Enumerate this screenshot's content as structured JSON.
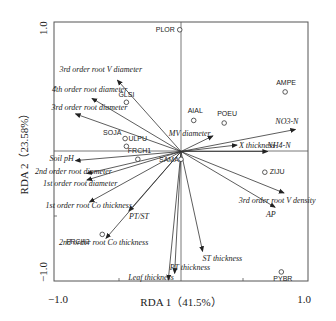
{
  "chart_data": {
    "type": "scatter",
    "subtype": "rda-biplot",
    "title": "",
    "xlabel": "RDA 1（41.5%）",
    "ylabel": "RDA 2（23.58%）",
    "xlim": [
      -1.0,
      1.0
    ],
    "ylim": [
      -1.0,
      1.0
    ],
    "x_tick_labels": [
      "-1.0",
      "1.0"
    ],
    "y_tick_labels": [
      "1.0",
      "-1.0"
    ],
    "grid": false,
    "legend": null,
    "environmental_variables": [
      {
        "name": "3rd order root V diameter",
        "x": -0.5,
        "y": 0.55
      },
      {
        "name": "4th order root diameter",
        "x": -0.7,
        "y": 0.41
      },
      {
        "name": "3rd order root diameter",
        "x": -0.83,
        "y": 0.29
      },
      {
        "name": "Soil pH",
        "x": -0.83,
        "y": -0.07
      },
      {
        "name": "2nd order root diameter",
        "x": -0.74,
        "y": -0.17
      },
      {
        "name": "1st order root diameter",
        "x": -0.74,
        "y": -0.22
      },
      {
        "name": "1st order root Co thickness",
        "x": -0.72,
        "y": -0.39
      },
      {
        "name": "PT/ST",
        "x": -0.41,
        "y": -0.46
      },
      {
        "name": "2nd order root Co thickness",
        "x": -0.59,
        "y": -0.67
      },
      {
        "name": "Leaf thickness",
        "x": -0.1,
        "y": -0.99
      },
      {
        "name": "PT thickness",
        "x": -0.05,
        "y": -0.94
      },
      {
        "name": "ST thickness",
        "x": 0.17,
        "y": -0.77
      },
      {
        "name": "AP",
        "x": 0.74,
        "y": -0.43
      },
      {
        "name": "3rd order root V density",
        "x": 0.81,
        "y": -0.32
      },
      {
        "name": "NH4-N",
        "x": 0.68,
        "y": 0.0
      },
      {
        "name": "X thickness",
        "x": 0.44,
        "y": 0.05
      },
      {
        "name": "MV diameter",
        "x": 0.25,
        "y": 0.12
      },
      {
        "name": "NO3-N",
        "x": 0.9,
        "y": 0.17
      }
    ],
    "species": [
      {
        "name": "PLOR",
        "x": -0.01,
        "y": 0.94
      },
      {
        "name": "AMPE",
        "x": 0.82,
        "y": 0.46
      },
      {
        "name": "AIAL",
        "x": 0.1,
        "y": 0.24
      },
      {
        "name": "POEU",
        "x": 0.34,
        "y": 0.22
      },
      {
        "name": "GLSI",
        "x": -0.43,
        "y": 0.38
      },
      {
        "name": "SOJA",
        "x": -0.44,
        "y": 0.1
      },
      {
        "name": "ULPU",
        "x": -0.43,
        "y": 0.04
      },
      {
        "name": "FRCH1",
        "x": -0.34,
        "y": -0.06
      },
      {
        "name": "SAMA",
        "x": 0.0,
        "y": -0.06
      },
      {
        "name": "ZIJU",
        "x": 0.66,
        "y": -0.16
      },
      {
        "name": "FRCH2",
        "x": -0.62,
        "y": -0.64
      },
      {
        "name": "PYBR",
        "x": 0.79,
        "y": -0.93
      }
    ]
  },
  "labels": {
    "xlabel": "RDA 1（41.5%）",
    "ylabel": "RDA 2（23.58%）",
    "xtick_min": "−1.0",
    "xtick_max": "1.0",
    "ytick_max": "1.0",
    "ytick_min": "−1.0"
  }
}
